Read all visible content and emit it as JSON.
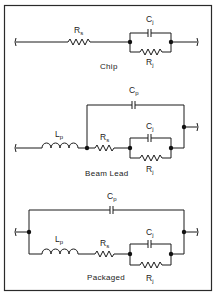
{
  "figure": {
    "border_color": "#2a2a2a",
    "wire_color": "#1a1a1a",
    "background": "#ffffff"
  },
  "circuits": [
    {
      "caption": "Chip",
      "components": {
        "series_resistor": {
          "main": "R",
          "sub": "s"
        },
        "junction_capacitor": {
          "main": "C",
          "sub": "j"
        },
        "junction_resistor": {
          "main": "R",
          "sub": "j"
        }
      }
    },
    {
      "caption": "Beam Lead",
      "components": {
        "parasitic_capacitor": {
          "main": "C",
          "sub": "p"
        },
        "lead_inductor": {
          "main": "L",
          "sub": "p"
        },
        "series_resistor": {
          "main": "R",
          "sub": "s"
        },
        "junction_capacitor": {
          "main": "C",
          "sub": "j"
        },
        "junction_resistor": {
          "main": "R",
          "sub": "j"
        }
      }
    },
    {
      "caption": "Packaged",
      "components": {
        "parasitic_capacitor": {
          "main": "C",
          "sub": "p"
        },
        "lead_inductor": {
          "main": "L",
          "sub": "p"
        },
        "series_resistor": {
          "main": "R",
          "sub": "s"
        },
        "junction_capacitor": {
          "main": "C",
          "sub": "j"
        },
        "junction_resistor": {
          "main": "R",
          "sub": "j"
        }
      }
    }
  ]
}
